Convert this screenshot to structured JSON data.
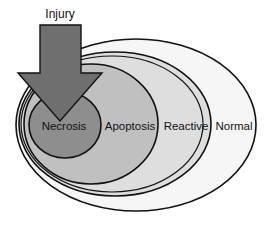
{
  "diagram": {
    "title": "Injury",
    "arrow": {
      "label": "Injury",
      "color": "#6e6e6e",
      "direction": "down"
    },
    "regions": [
      {
        "name": "Normal",
        "fill": "#f4f4f4"
      },
      {
        "name": "Reactive",
        "fill": "#dcdcdc"
      },
      {
        "name": "Apoptosis",
        "fill": "#bdbdbd"
      },
      {
        "name": "Necrosis",
        "fill": "#8c8c8c"
      }
    ],
    "labels": {
      "necrosis": "Necrosis",
      "apoptosis": "Apoptosis",
      "reactive": "Reactive",
      "normal": "Normal"
    }
  }
}
